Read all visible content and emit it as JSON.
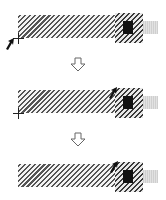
{
  "diagram": {
    "steps": [
      {
        "index": 1,
        "track": {
          "x": 18,
          "y": 15,
          "w": 97,
          "h": 23
        },
        "handle": {
          "x": 115,
          "y": 13,
          "w": 28,
          "h": 30
        },
        "knob": {
          "x": 123,
          "y": 21,
          "w": 10,
          "h": 13
        },
        "tab": {
          "x": 143,
          "y": 21,
          "w": 15,
          "h": 13
        },
        "crosshair": {
          "x": 18,
          "y": 38
        },
        "cursor": {
          "x": 10,
          "y": 44
        }
      },
      {
        "index": 2,
        "track": {
          "x": 18,
          "y": 90,
          "w": 97,
          "h": 23
        },
        "handle": {
          "x": 115,
          "y": 88,
          "w": 28,
          "h": 30
        },
        "knob": {
          "x": 123,
          "y": 96,
          "w": 10,
          "h": 13
        },
        "tab": {
          "x": 143,
          "y": 96,
          "w": 15,
          "h": 13
        },
        "crosshair": {
          "x": 18,
          "y": 113
        },
        "cursor": {
          "x": 112,
          "y": 89
        }
      },
      {
        "index": 3,
        "track": {
          "x": 18,
          "y": 164,
          "w": 97,
          "h": 23
        },
        "handle": {
          "x": 115,
          "y": 162,
          "w": 28,
          "h": 30
        },
        "knob": {
          "x": 123,
          "y": 170,
          "w": 10,
          "h": 13
        },
        "tab": {
          "x": 143,
          "y": 170,
          "w": 15,
          "h": 13
        },
        "crosshair": null,
        "cursor": {
          "x": 113,
          "y": 163
        }
      }
    ],
    "transitions": [
      {
        "icon": "down-arrow-icon",
        "x": 70,
        "y": 57
      },
      {
        "icon": "down-arrow-icon",
        "x": 70,
        "y": 132
      }
    ],
    "colors": {
      "hatch": "#555555",
      "knob": "#111111",
      "tab": "#d6d6d6",
      "arrow_outline": "#666666",
      "cursor": "#111111"
    }
  }
}
